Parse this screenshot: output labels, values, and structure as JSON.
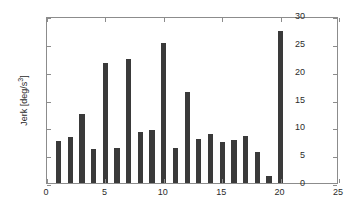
{
  "chart_data": {
    "type": "bar",
    "title": "",
    "subtitle": "",
    "xlabel": "",
    "ylabel": "Jerk [deg/s",
    "ylabel_exponent": "3",
    "ylabel_suffix": "]",
    "ylabel_full": "Jerk [deg/s³]",
    "categories": [
      1,
      2,
      3,
      4,
      5,
      6,
      7,
      8,
      9,
      10,
      11,
      12,
      13,
      14,
      15,
      16,
      17,
      18,
      19,
      20
    ],
    "values": [
      7.5,
      8.3,
      12.4,
      6.1,
      21.5,
      6.3,
      22.3,
      9.2,
      9.5,
      25.1,
      6.3,
      16.4,
      7.9,
      8.8,
      7.4,
      7.7,
      8.4,
      5.6,
      1.3,
      27.3
    ],
    "xlim": [
      0,
      25
    ],
    "ylim": [
      0,
      30
    ],
    "xticks": [
      0,
      5,
      10,
      15,
      20,
      25
    ],
    "yticks": [
      0,
      5,
      10,
      15,
      20,
      25,
      30
    ],
    "xtick_labels": [
      "0",
      "5",
      "10",
      "15",
      "20",
      "25"
    ],
    "ytick_labels": [
      "0",
      "5",
      "10",
      "15",
      "20",
      "25",
      "30"
    ],
    "grid": false,
    "legend": null,
    "bar_color": "#3a3a3a",
    "axis_color": "#8c8c8c",
    "background_color": "#ffffff",
    "bar_width_units": 0.45
  }
}
